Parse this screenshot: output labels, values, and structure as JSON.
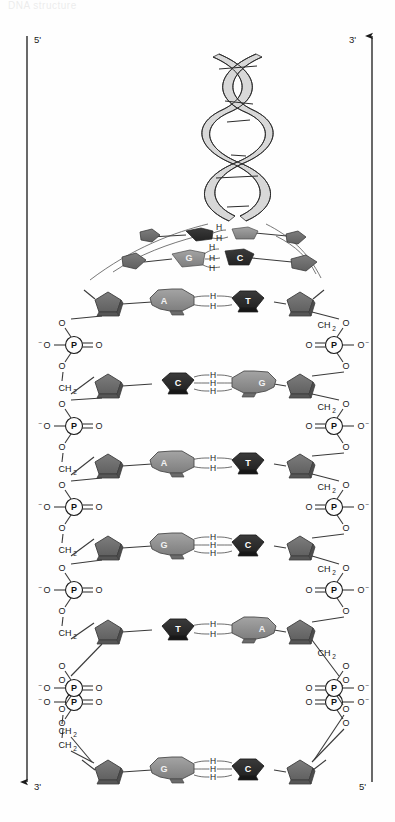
{
  "figure": {
    "title_cut": "DNA structure",
    "axes": {
      "left": {
        "top_label": "5'",
        "bottom_label": "3'",
        "arrow": "down-arrow"
      },
      "right": {
        "top_label": "3'",
        "bottom_label": "5'",
        "arrow": "up-arrow"
      }
    },
    "helix": {
      "name": "dna-double-helix",
      "turns": 3
    },
    "labels": {
      "phosphate": "P",
      "oxygen": "O",
      "oxygen_anion": "O",
      "anion_sign": "−",
      "methylene": "CH",
      "methylene_sub": "2",
      "hydrogen_bond": "H"
    },
    "transition_rows": [
      {
        "left_base": "A",
        "right_base": "T",
        "hbonds": 2
      },
      {
        "left_base": "G",
        "right_base": "C",
        "hbonds": 3
      }
    ],
    "base_pairs": [
      {
        "index": 1,
        "left_base": "A",
        "right_base": "T",
        "hbonds": 2,
        "left_shade": "light",
        "right_shade": "dark"
      },
      {
        "index": 2,
        "left_base": "C",
        "right_base": "G",
        "hbonds": 3,
        "left_shade": "dark",
        "right_shade": "light"
      },
      {
        "index": 3,
        "left_base": "A",
        "right_base": "T",
        "hbonds": 2,
        "left_shade": "light",
        "right_shade": "dark"
      },
      {
        "index": 4,
        "left_base": "G",
        "right_base": "C",
        "hbonds": 3,
        "left_shade": "light",
        "right_shade": "dark"
      },
      {
        "index": 5,
        "left_base": "T",
        "right_base": "A",
        "hbonds": 2,
        "left_shade": "dark",
        "right_shade": "light"
      },
      {
        "index": 6,
        "left_base": "G",
        "right_base": "C",
        "hbonds": 3,
        "left_shade": "light",
        "right_shade": "dark"
      }
    ],
    "colors": {
      "base_light": "#8c8c8c",
      "base_dark": "#2e2e2e",
      "sugar": "#6f6f6f",
      "sugar_edge": "#4a4a4a",
      "ink": "#1a1a1a",
      "background": "#fefefe"
    }
  }
}
